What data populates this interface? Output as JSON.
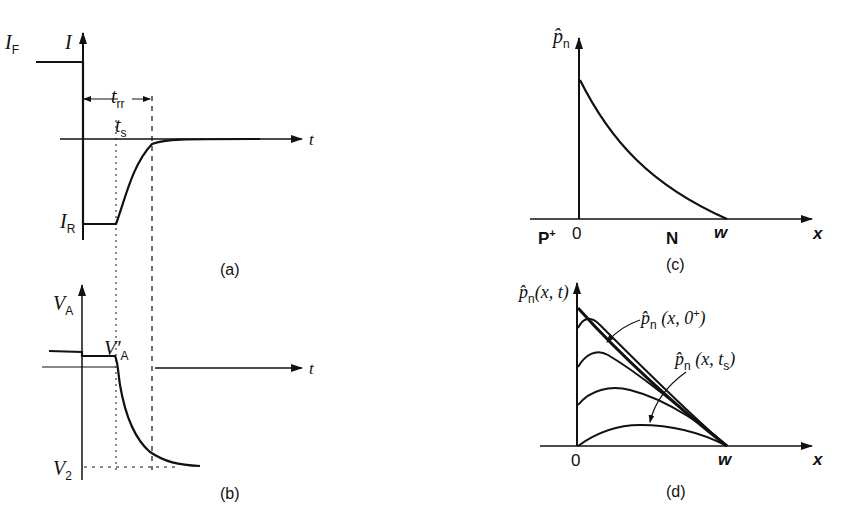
{
  "figure": {
    "panels": {
      "a": {
        "caption": "(a)",
        "y_axis": "I",
        "x_axis": "t",
        "labels": {
          "forward_current": "I",
          "forward_current_sub": "F",
          "reverse_current": "I",
          "reverse_current_sub": "R",
          "recovery_time": "t",
          "recovery_time_sub": "rr",
          "storage_time": "t",
          "storage_time_sub": "s"
        }
      },
      "b": {
        "caption": "(b)",
        "y_axis": "V",
        "y_axis_sub": "A",
        "x_axis": "t",
        "labels": {
          "step_voltage": "V",
          "step_voltage_prime": "′",
          "step_voltage_sub": "A",
          "final_voltage": "V",
          "final_voltage_sub": "2"
        }
      },
      "c": {
        "caption": "(c)",
        "y_axis": "p̂",
        "y_axis_sub": "n",
        "x_axis": "x",
        "labels": {
          "region_p": "P",
          "region_p_sup": "+",
          "origin": "0",
          "region_n": "N",
          "width": "w"
        }
      },
      "d": {
        "caption": "(d)",
        "y_axis": "p̂",
        "y_axis_sub": "n",
        "y_axis_args": "(x, t)",
        "x_axis": "x",
        "labels": {
          "origin": "0",
          "width": "w",
          "initial_curve": "p̂",
          "initial_curve_sub": "n",
          "initial_curve_args": " (x, 0",
          "initial_curve_sup": "+",
          "initial_curve_close": ")",
          "storage_curve": "p̂",
          "storage_curve_sub": "n",
          "storage_curve_args": " (x, t",
          "storage_curve_args_sub": "s",
          "storage_curve_close": ")"
        }
      }
    }
  }
}
